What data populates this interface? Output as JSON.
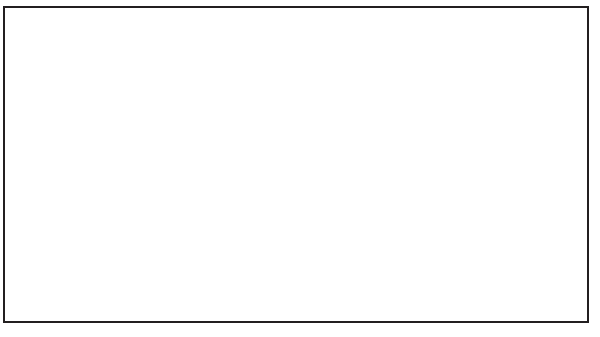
{
  "chart_data": {
    "type": "line",
    "title": "Inflation Rate",
    "xlabel": "",
    "ylabel": "",
    "grid": false,
    "legend_position": "top-left-inside",
    "x": [
      1966,
      1967,
      1968,
      1969,
      1970,
      1971,
      1972,
      1973,
      1974,
      1975,
      1976,
      1977,
      1978,
      1979,
      1980,
      1981,
      1982,
      1983,
      1984,
      1985
    ],
    "xtick_labels": [
      "1966",
      "'67",
      "'68",
      "'69",
      "'70",
      "'71",
      "'72",
      "'73",
      "'74",
      "'75",
      "'76",
      "'77",
      "'78",
      "'79",
      "'80",
      "'81",
      "'82",
      "'83",
      "'84",
      "'85"
    ],
    "ytick_labels": [
      "0%",
      "4%",
      "8%",
      "12%",
      "16%",
      "20%",
      "24%",
      "28%"
    ],
    "ytick_values": [
      0,
      4,
      8,
      12,
      16,
      20,
      24,
      28
    ],
    "ylim": [
      0,
      28
    ],
    "xlim": [
      1966,
      1985
    ],
    "series": [
      {
        "name": "United States",
        "color": "#e4e4e4",
        "width": 3.0,
        "values": [
          3.0,
          2.8,
          4.2,
          5.4,
          5.9,
          4.3,
          3.3,
          6.2,
          11.0,
          9.1,
          5.8,
          6.5,
          7.6,
          11.3,
          13.5,
          10.3,
          6.2,
          3.2,
          4.3,
          3.6
        ]
      },
      {
        "name": "Canada",
        "color": "#b3b3b3",
        "width": 3.0,
        "values": [
          3.7,
          3.6,
          4.0,
          4.6,
          3.3,
          2.9,
          4.8,
          7.6,
          10.9,
          10.8,
          7.5,
          8.0,
          9.0,
          9.1,
          10.2,
          12.5,
          10.8,
          5.8,
          4.4,
          4.0
        ]
      },
      {
        "name": "Japan",
        "color": "#111111",
        "width": 3.0,
        "values": [
          5.2,
          4.1,
          5.3,
          5.2,
          7.3,
          6.4,
          4.8,
          11.8,
          24.5,
          11.8,
          9.3,
          8.1,
          4.2,
          3.6,
          8.0,
          4.9,
          2.7,
          1.9,
          2.3,
          2.0
        ]
      },
      {
        "name": "United Kingdom",
        "color": "#d7d7d7",
        "width": 3.0,
        "values": [
          3.9,
          2.5,
          4.7,
          5.4,
          6.4,
          9.4,
          7.1,
          9.2,
          16.0,
          24.2,
          16.5,
          15.8,
          8.3,
          13.4,
          18.0,
          11.9,
          8.6,
          4.6,
          5.0,
          6.1
        ]
      },
      {
        "name": "West Germany",
        "color": "#8a8a8a",
        "width": 3.0,
        "values": [
          3.5,
          1.4,
          1.6,
          1.9,
          3.4,
          5.3,
          5.5,
          6.9,
          7.0,
          6.0,
          4.5,
          3.7,
          2.7,
          4.1,
          5.4,
          6.3,
          5.3,
          3.3,
          2.4,
          2.2
        ]
      },
      {
        "name": "France",
        "color": "#555555",
        "width": 3.5,
        "values": [
          2.7,
          2.7,
          4.5,
          6.4,
          5.2,
          5.5,
          6.2,
          7.3,
          13.7,
          11.8,
          9.6,
          9.4,
          9.1,
          10.8,
          13.3,
          13.0,
          11.8,
          9.6,
          7.4,
          5.8
        ]
      },
      {
        "name": "Italy",
        "color": "#969696",
        "width": 3.0,
        "values": [
          2.3,
          3.7,
          1.4,
          2.6,
          5.0,
          4.8,
          5.7,
          10.8,
          19.1,
          17.0,
          16.8,
          17.0,
          12.1,
          14.8,
          20.0,
          18.7,
          16.4,
          14.7,
          10.8,
          8.5
        ]
      }
    ]
  },
  "legend": {
    "title": "Inflation Rate",
    "items": [
      {
        "label": "United States"
      },
      {
        "label": "Canada"
      },
      {
        "label": "Japan"
      },
      {
        "label": "United Kingdom"
      },
      {
        "label": "West Germany"
      },
      {
        "label": "France"
      },
      {
        "label": "Italy"
      }
    ]
  }
}
